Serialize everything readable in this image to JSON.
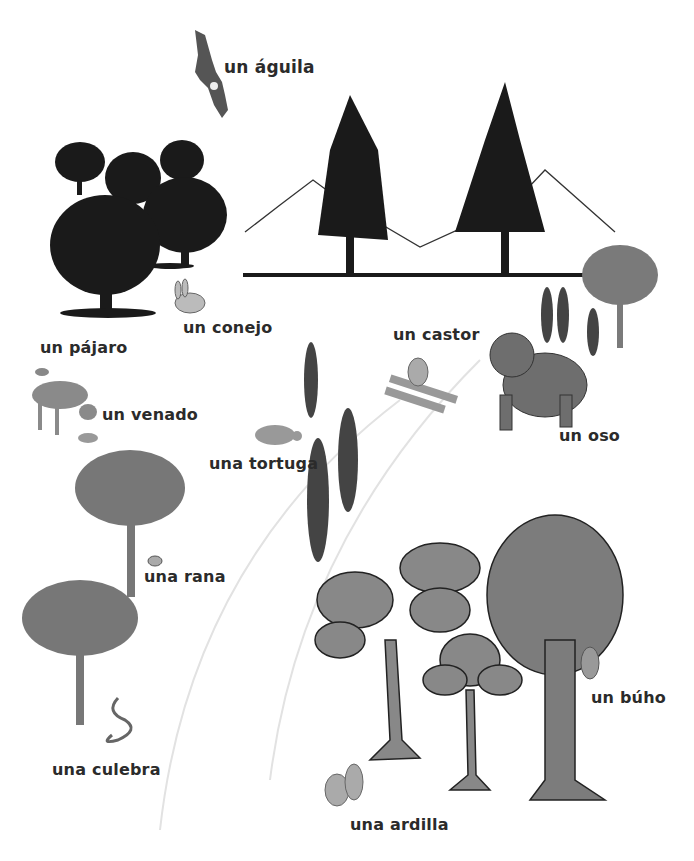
{
  "scene": {
    "description": "Forest habitat illustration with Spanish animal vocabulary labels",
    "colors": {
      "silhouette": "#1a1a1a",
      "gray_tree": "#7a7a7a",
      "cartoon_tree": "#888888",
      "label_text": "#2b2b2b",
      "path_arc": "#dddddd"
    }
  },
  "labels": {
    "aguila": "un águila",
    "conejo": "un conejo",
    "pajaro": "un pájaro",
    "venado": "un venado",
    "castor": "un castor",
    "oso": "un oso",
    "tortuga": "una tortuga",
    "rana": "una rana",
    "culebra": "una culebra",
    "buho": "un búho",
    "ardilla": "una ardilla"
  }
}
